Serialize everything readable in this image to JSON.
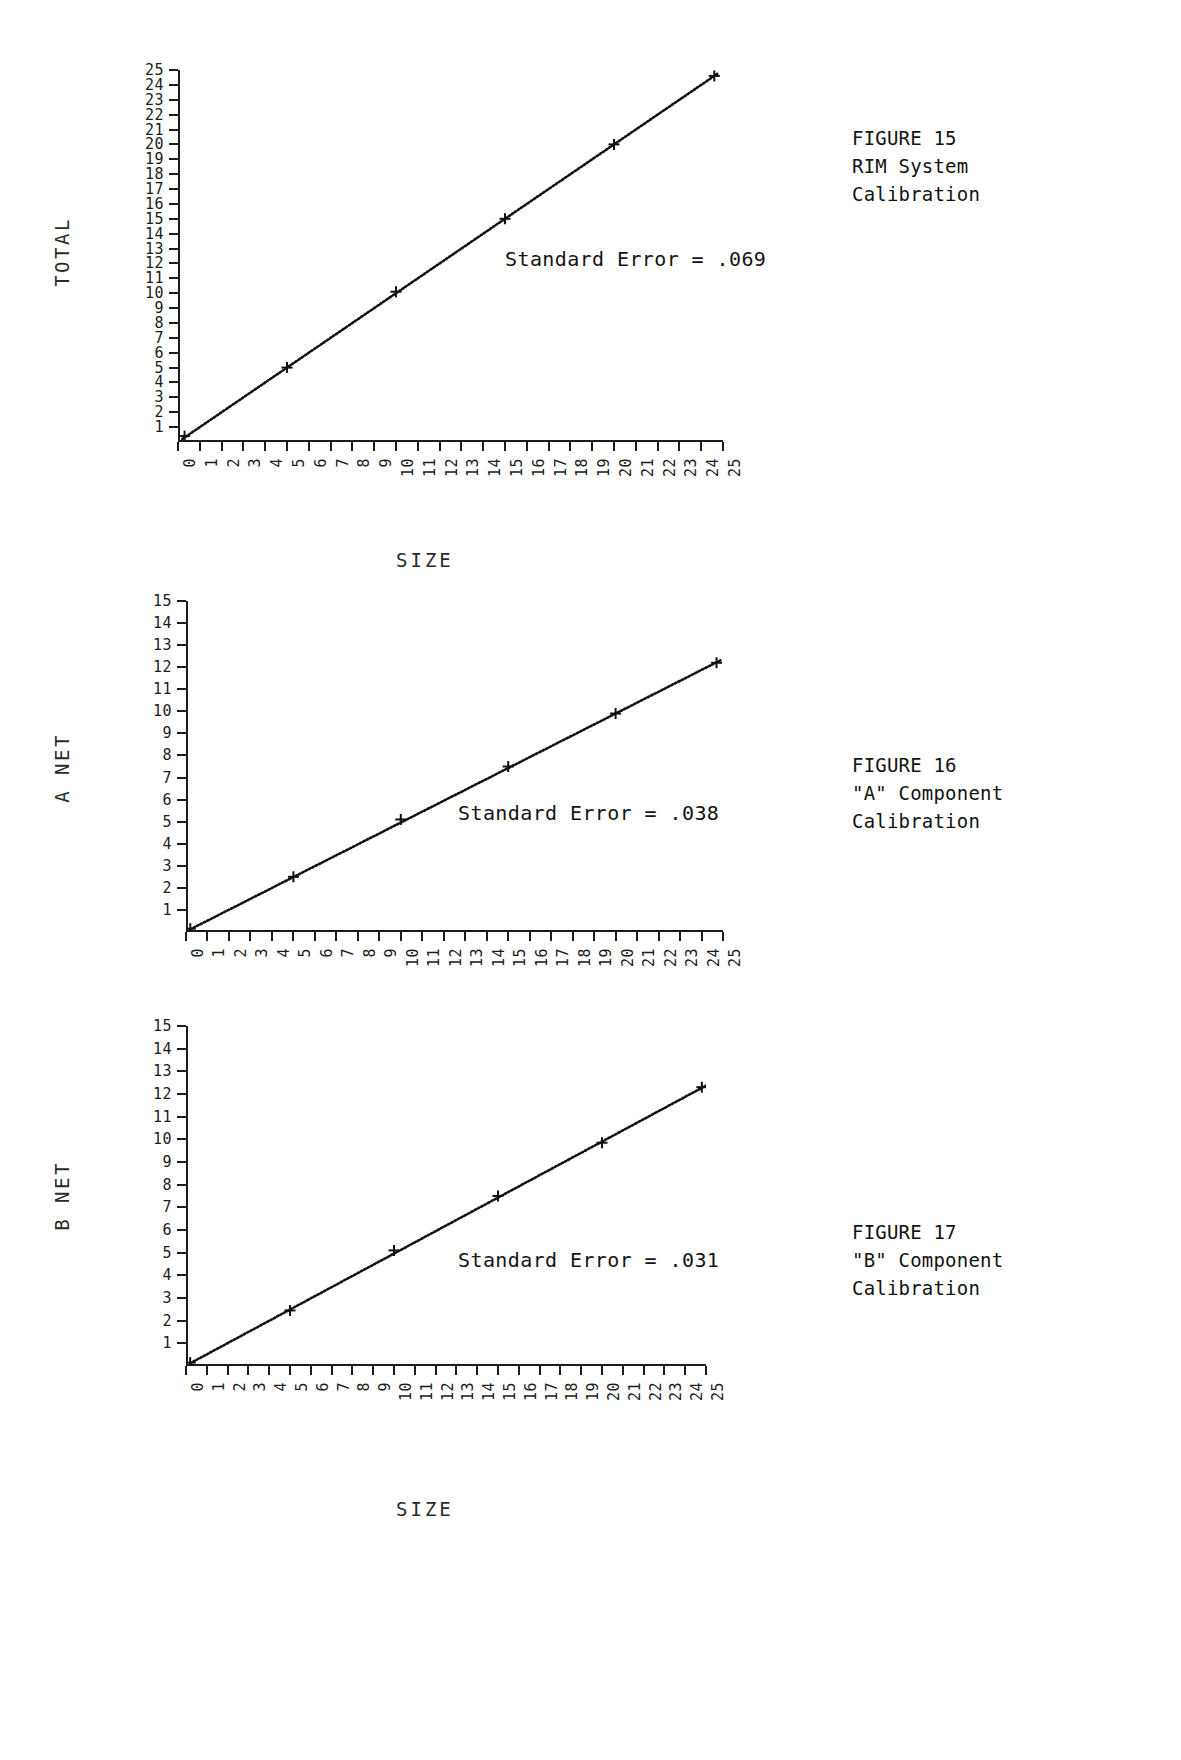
{
  "page": {
    "background": "#ffffff",
    "ink": "#1a1a1a"
  },
  "figures": [
    {
      "id": "figure-15",
      "caption_lines": [
        "FIGURE 15",
        "RIM System",
        "Calibration"
      ],
      "y_axis_title": "TOTAL",
      "x_axis_title": "SIZE",
      "annotation": "Standard Error = .069",
      "chart_data": {
        "type": "scatter",
        "title": "RIM System Calibration",
        "xlabel": "SIZE",
        "ylabel": "TOTAL",
        "xlim": [
          0,
          25
        ],
        "ylim": [
          0,
          25
        ],
        "xticks": [
          0,
          1,
          2,
          3,
          4,
          5,
          6,
          7,
          8,
          9,
          10,
          11,
          12,
          13,
          14,
          15,
          16,
          17,
          18,
          19,
          20,
          21,
          22,
          23,
          24,
          25
        ],
        "yticks": [
          1,
          2,
          3,
          4,
          5,
          6,
          7,
          8,
          9,
          10,
          11,
          12,
          13,
          14,
          15,
          16,
          17,
          18,
          19,
          20,
          21,
          22,
          23,
          24,
          25
        ],
        "grid": false,
        "legend": null,
        "annotations": [
          "Standard Error = .069"
        ],
        "series": [
          {
            "name": "TOTAL vs SIZE",
            "marker": "plus",
            "x": [
              0.3,
              5.0,
              10.0,
              15.0,
              20.0,
              24.6
            ],
            "y": [
              0.4,
              5.0,
              10.1,
              15.0,
              20.0,
              24.6
            ]
          }
        ],
        "fit_line": {
          "slope": 1.0,
          "intercept": 0.0,
          "x_start": 0.2,
          "x_end": 24.8,
          "style": "dotted"
        }
      }
    },
    {
      "id": "figure-16",
      "caption_lines": [
        "FIGURE 16",
        "\"A\" Component",
        "Calibration"
      ],
      "y_axis_title": "A NET",
      "x_axis_title": "SIZE",
      "annotation": "Standard Error = .038",
      "chart_data": {
        "type": "scatter",
        "title": "\"A\" Component Calibration",
        "xlabel": "SIZE",
        "ylabel": "A NET",
        "xlim": [
          0,
          25
        ],
        "ylim": [
          0,
          15
        ],
        "xticks": [
          0,
          1,
          2,
          3,
          4,
          5,
          6,
          7,
          8,
          9,
          10,
          11,
          12,
          13,
          14,
          15,
          16,
          17,
          18,
          19,
          20,
          21,
          22,
          23,
          24,
          25
        ],
        "yticks": [
          1,
          2,
          3,
          4,
          5,
          6,
          7,
          8,
          9,
          10,
          11,
          12,
          13,
          14,
          15
        ],
        "grid": false,
        "legend": null,
        "annotations": [
          "Standard Error = .038"
        ],
        "series": [
          {
            "name": "A NET vs SIZE",
            "marker": "plus",
            "x": [
              0.2,
              5.0,
              10.0,
              15.0,
              20.0,
              24.7
            ],
            "y": [
              0.15,
              2.5,
              5.1,
              7.5,
              9.9,
              12.2
            ]
          }
        ],
        "fit_line": {
          "slope": 0.494,
          "intercept": 0.02,
          "x_start": 0.2,
          "x_end": 24.9,
          "style": "dotted"
        }
      }
    },
    {
      "id": "figure-17",
      "caption_lines": [
        "FIGURE 17",
        "\"B\" Component",
        "Calibration"
      ],
      "y_axis_title": "B NET",
      "x_axis_title": "SIZE",
      "annotation": "Standard Error = .031",
      "chart_data": {
        "type": "scatter",
        "title": "\"B\" Component Calibration",
        "xlabel": "SIZE",
        "ylabel": "B NET",
        "xlim": [
          0,
          25
        ],
        "ylim": [
          0,
          15
        ],
        "xticks": [
          0,
          1,
          2,
          3,
          4,
          5,
          6,
          7,
          8,
          9,
          10,
          11,
          12,
          13,
          14,
          15,
          16,
          17,
          18,
          19,
          20,
          21,
          22,
          23,
          24,
          25
        ],
        "yticks": [
          1,
          2,
          3,
          4,
          5,
          6,
          7,
          8,
          9,
          10,
          11,
          12,
          13,
          14,
          15
        ],
        "grid": false,
        "legend": null,
        "annotations": [
          "Standard Error = .031"
        ],
        "series": [
          {
            "name": "B NET vs SIZE",
            "marker": "plus",
            "x": [
              0.2,
              5.0,
              10.0,
              15.0,
              20.0,
              24.8
            ],
            "y": [
              0.15,
              2.45,
              5.1,
              7.5,
              9.85,
              12.3
            ]
          }
        ],
        "fit_line": {
          "slope": 0.494,
          "intercept": 0.02,
          "x_start": 0.2,
          "x_end": 25.0,
          "style": "dotted"
        }
      }
    }
  ]
}
